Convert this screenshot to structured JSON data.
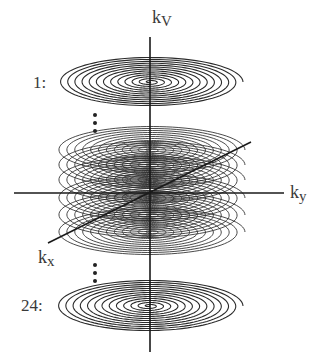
{
  "figure": {
    "axes": {
      "vertical": {
        "label_base": "k",
        "label_sub": "V"
      },
      "horizontal": {
        "label_base": "k",
        "label_sub": "y"
      },
      "diagonal": {
        "label_base": "k",
        "label_sub": "x"
      }
    },
    "slices": {
      "first_label": "1:",
      "last_label": "24:",
      "total": 24,
      "ellipsis": "⋮"
    },
    "colors": {
      "spiral": "#2b2b2b",
      "axis": "#1a1a1a",
      "text": "#3a3a3a",
      "background": "#ffffff"
    }
  }
}
